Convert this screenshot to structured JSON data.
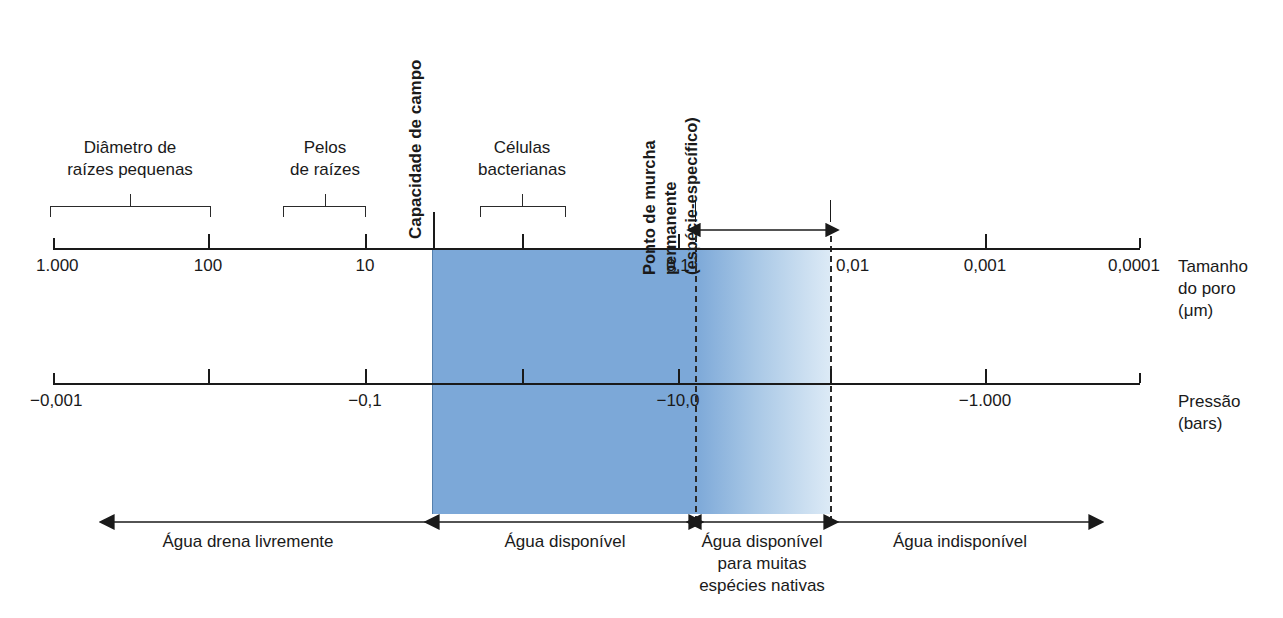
{
  "figure": {
    "type": "scale-diagram",
    "language": "pt-BR"
  },
  "axes": {
    "pore_size": {
      "title_line1": "Tamanho",
      "title_line2": "do poro",
      "title_line3": "(μm)",
      "unit": "μm",
      "ticks": [
        {
          "label": "1.000",
          "x": 53
        },
        {
          "label": "100",
          "x": 208
        },
        {
          "label": "10",
          "x": 365
        },
        {
          "label": "0,1",
          "x": 678
        },
        {
          "label": "0,01",
          "x": 830
        },
        {
          "label": "0,001",
          "x": 985
        },
        {
          "label": "0,0001",
          "x": 1140
        }
      ],
      "unlabeled_ticks": [
        522
      ]
    },
    "pressure": {
      "title_line1": "Pressão",
      "title_line2": "(bars)",
      "unit": "bars",
      "ticks": [
        {
          "label": "−0,001",
          "x": 53
        },
        {
          "label": "−0,1",
          "x": 365
        },
        {
          "label": "−10,0",
          "x": 678
        },
        {
          "label": "−1.000",
          "x": 985
        }
      ],
      "unlabeled_ticks": [
        208,
        522,
        830,
        1140
      ]
    }
  },
  "feature_groups": [
    {
      "name": "root-diameter",
      "line1": "Diâmetro de",
      "line2": "raízes pequenas",
      "bracket_left": 50,
      "bracket_right": 210,
      "stem": 130
    },
    {
      "name": "root-hairs",
      "line1": "Pelos",
      "line2": "de raízes",
      "bracket_left": 283,
      "bracket_right": 365,
      "stem": 325
    },
    {
      "name": "bacterial-cells",
      "line1": "Células",
      "line2": "bacterianas",
      "bracket_left": 480,
      "bracket_right": 565,
      "stem": 522
    }
  ],
  "markers": {
    "field_capacity": {
      "label": "Capacidade de campo",
      "x": 433
    },
    "wilting_point": {
      "line1": "Ponto de murcha",
      "line2": "permanente",
      "line3": "(espécie-específico)",
      "range_left": 695,
      "range_right": 830
    }
  },
  "water_zones": [
    {
      "name": "free-draining",
      "line1": "Água drena livremente",
      "line2": "",
      "line3": "",
      "center": 248
    },
    {
      "name": "available-water",
      "line1": "Água disponível",
      "line2": "",
      "line3": "",
      "center": 565
    },
    {
      "name": "available-native-species",
      "line1": "Água disponível",
      "line2": "para muitas",
      "line3": "espécies nativas",
      "center": 762
    },
    {
      "name": "unavailable-water",
      "line1": "Água indisponível",
      "line2": "",
      "line3": "",
      "center": 960
    }
  ],
  "colors": {
    "water_solid": "#7CA8D8",
    "water_fade_end": "#DCEAF6",
    "ink": "#1a1a1a"
  }
}
